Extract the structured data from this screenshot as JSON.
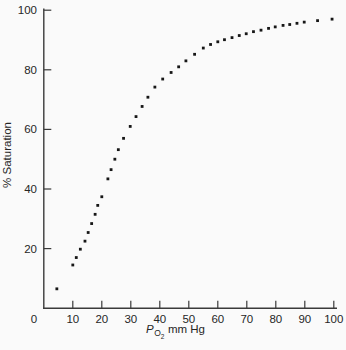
{
  "figure": {
    "background": "#fafafa",
    "axis_color": "#3a3a3a",
    "dot_color": "#161616",
    "text_color": "#262626",
    "y_axis_title": "% Saturation",
    "x_axis_title": {
      "p": "P",
      "sub_o": "O",
      "sub_2": "2",
      "rest": "mm Hg"
    },
    "origin_label": "0"
  },
  "chart_data": {
    "type": "scatter",
    "title": "",
    "xlabel": "P_O2 mm Hg",
    "ylabel": "% Saturation",
    "xlim": [
      0,
      101
    ],
    "ylim": [
      0,
      100
    ],
    "x_ticks": [
      10,
      20,
      30,
      40,
      50,
      60,
      70,
      80,
      90,
      100
    ],
    "y_ticks": [
      20,
      40,
      60,
      80,
      100
    ],
    "grid": false,
    "legend": null,
    "marker": "square",
    "points": [
      [
        4.5,
        6.5
      ],
      [
        10,
        14.5
      ],
      [
        11.2,
        17
      ],
      [
        12.6,
        19.8
      ],
      [
        14.2,
        22.5
      ],
      [
        15.3,
        25.4
      ],
      [
        16.5,
        28.4
      ],
      [
        17.7,
        31.5
      ],
      [
        18.6,
        34.5
      ],
      [
        20,
        37.4
      ],
      [
        22.1,
        43.4
      ],
      [
        23.2,
        46.5
      ],
      [
        24.5,
        50
      ],
      [
        25.7,
        53.2
      ],
      [
        27.5,
        57
      ],
      [
        29.8,
        61
      ],
      [
        31.8,
        64.3
      ],
      [
        33.9,
        67.7
      ],
      [
        35.9,
        70.8
      ],
      [
        38.3,
        74.2
      ],
      [
        41,
        76.9
      ],
      [
        43.9,
        79.1
      ],
      [
        46.5,
        81
      ],
      [
        49,
        83
      ],
      [
        52,
        85.2
      ],
      [
        55,
        87.3
      ],
      [
        57.5,
        88.5
      ],
      [
        60,
        89.4
      ],
      [
        62.3,
        90.1
      ],
      [
        64.9,
        90.8
      ],
      [
        67.4,
        91.5
      ],
      [
        69.8,
        92.1
      ],
      [
        72.3,
        92.8
      ],
      [
        74.9,
        93.3
      ],
      [
        77.5,
        93.9
      ],
      [
        79.8,
        94.4
      ],
      [
        82.5,
        94.9
      ],
      [
        84.8,
        95.2
      ],
      [
        87.3,
        95.6
      ],
      [
        89.8,
        96
      ],
      [
        94.4,
        96.5
      ],
      [
        99.4,
        97
      ]
    ]
  }
}
